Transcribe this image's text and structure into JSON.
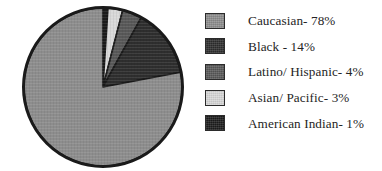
{
  "chart_data": {
    "type": "pie",
    "title": "",
    "subtitle": "",
    "xlabel": "",
    "ylabel": "",
    "grid": false,
    "legend_position": "right",
    "categories": [
      "Caucasian",
      "Black",
      "Latino/ Hispanic",
      "Asian/ Pacific",
      "American Indian"
    ],
    "values": [
      78,
      14,
      4,
      3,
      1
    ],
    "value_unit": "%",
    "start_angle_deg": 0,
    "direction": "clockwise",
    "slice_order_clockwise_from_top": [
      "American Indian",
      "Asian/ Pacific",
      "Latino/ Hispanic",
      "Black",
      "Caucasian"
    ],
    "slices": [
      {
        "label": "American Indian",
        "value": 1,
        "color": "#1c1c1c"
      },
      {
        "label": "Asian/ Pacific",
        "value": 3,
        "color": "#d8d8d8"
      },
      {
        "label": "Latino/ Hispanic",
        "value": 4,
        "color": "#585858"
      },
      {
        "label": "Black",
        "value": 14,
        "color": "#2e2e2e"
      },
      {
        "label": "Caucasian",
        "value": 78,
        "color": "#8d8d8d"
      }
    ],
    "outline_color": "#1a1a1a"
  },
  "legend": {
    "items": [
      {
        "label": "Caucasian- 78%",
        "swatch_color": "#8d8d8d",
        "swatch_name": "legend-swatch-caucasian"
      },
      {
        "label": "Black - 14%",
        "swatch_color": "#2e2e2e",
        "swatch_name": "legend-swatch-black"
      },
      {
        "label": "Latino/ Hispanic- 4%",
        "swatch_color": "#585858",
        "swatch_name": "legend-swatch-latino-hispanic"
      },
      {
        "label": "Asian/ Pacific- 3%",
        "swatch_color": "#d8d8d8",
        "swatch_name": "legend-swatch-asian-pacific"
      },
      {
        "label": "American Indian- 1%",
        "swatch_color": "#1c1c1c",
        "swatch_name": "legend-swatch-american-indian"
      }
    ]
  }
}
